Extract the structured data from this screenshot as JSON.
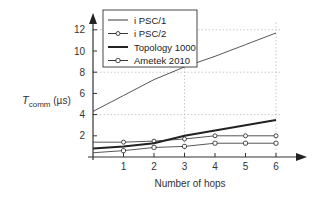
{
  "chart_data": {
    "type": "line",
    "title": "",
    "xlabel": "Number of hops",
    "ylabel": "T_comm (µs)",
    "ylabel_main": "T",
    "ylabel_sub": "comm",
    "ylabel_unit": " (µs)",
    "x": [
      0,
      1,
      2,
      3,
      4,
      5,
      6
    ],
    "xticks": [
      1,
      2,
      3,
      4,
      5,
      6
    ],
    "yticks": [
      2,
      4,
      6,
      8,
      10,
      12
    ],
    "xlim": [
      0,
      6.8
    ],
    "ylim": [
      0,
      13.5
    ],
    "grid": {
      "x": [
        3,
        6
      ],
      "y": [
        4,
        8,
        12
      ],
      "style": "dotted"
    },
    "legend_position": "upper-left-inside",
    "series": [
      {
        "name": "i PSC/1",
        "marker": "none",
        "weight": "thin",
        "values": [
          4.3,
          5.8,
          7.3,
          8.5,
          9.5,
          10.6,
          11.7
        ]
      },
      {
        "name": "i PSC/2",
        "marker": "circle",
        "weight": "thin",
        "values": [
          1.4,
          1.4,
          1.5,
          1.7,
          2.0,
          2.0,
          2.0
        ]
      },
      {
        "name": "Topology 1000",
        "marker": "none",
        "weight": "thick",
        "values": [
          0.8,
          1.0,
          1.3,
          2.0,
          2.5,
          3.0,
          3.5
        ]
      },
      {
        "name": "Ametek 2010",
        "marker": "square",
        "weight": "thin",
        "values": [
          0.4,
          0.6,
          0.9,
          1.0,
          1.3,
          1.3,
          1.3
        ]
      }
    ]
  }
}
